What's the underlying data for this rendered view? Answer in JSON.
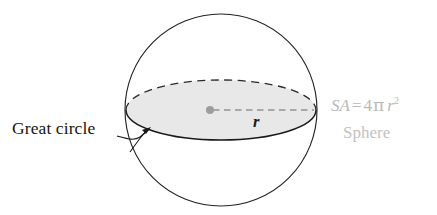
{
  "figure": {
    "background_color": "#ffffff"
  },
  "labels": {
    "great_circle": "Great circle",
    "radius_variable": "r",
    "sphere_name": "Sphere"
  },
  "formula": {
    "lhs": "SA",
    "equals": "=",
    "coefficient": "4",
    "pi": "π",
    "variable": "r",
    "exponent": "2",
    "full_text": "SA = 4πr²"
  },
  "colors": {
    "outline": "#222222",
    "great_circle_fill": "#e8e8e8",
    "great_circle_front_stroke": "#1a1a1a",
    "great_circle_back_stroke": "#2a2a2a",
    "radius_line": "#a8a8a8",
    "center_dot": "#9a9a9a",
    "formula_text": "#b9b9b9",
    "sphere_text": "#c2c2c2",
    "label_text": "#161616",
    "leader_line": "#1a1a1a"
  },
  "geometry": {
    "sphere": {
      "cx": 221,
      "cy": 110,
      "r": 96
    },
    "great_circle": {
      "cx": 221,
      "cy": 110,
      "rx": 95,
      "ry": 30
    },
    "center_dot": {
      "cx": 210,
      "cy": 110,
      "r": 3.6
    },
    "radius_line": {
      "x1": 212,
      "y1": 110,
      "x2": 314,
      "y2": 110
    }
  }
}
